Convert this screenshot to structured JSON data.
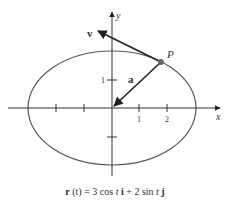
{
  "diagram": {
    "caption_parts": {
      "r": "r",
      "t_arg": " (t) = 3 cos ",
      "t1": "t",
      "i": " i",
      "mid": " + 2 sin ",
      "t2": "t",
      "j": " j"
    },
    "caption": "r (t) = 3 cos t i + 2 sin t j",
    "axes": {
      "x_label": "x",
      "y_label": "y"
    },
    "x_ticks": [
      "1",
      "2"
    ],
    "y_ticks": [
      "1"
    ],
    "point_label": "P",
    "vector_labels": {
      "velocity": "v",
      "acceleration": "a"
    },
    "ellipse": {
      "semi_major_x": 3,
      "semi_minor_y": 2
    },
    "colors": {
      "curve": "#555555",
      "axis": "#333333",
      "vector": "#222222",
      "point": "#666666"
    }
  }
}
